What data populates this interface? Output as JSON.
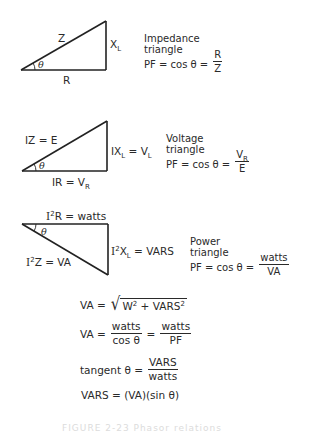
{
  "impedance": {
    "hyp_label": "Z",
    "vert_label_main": "X",
    "vert_label_sub": "L",
    "angle_label": "θ",
    "base_label": "R",
    "title_line1": "Impedance",
    "title_line2": "triangle",
    "pf_prefix": "PF = cos θ =",
    "pf_num": "R",
    "pf_den": "Z"
  },
  "voltage": {
    "hyp_label": "IZ = E",
    "vert_label_a": "IX",
    "vert_label_a_sub": "L",
    "vert_label_b": " = V",
    "vert_label_b_sub": "L",
    "angle_label": "θ",
    "base_label": "IR = V",
    "base_label_sub": "R",
    "title_line1": "Voltage",
    "title_line2": "triangle",
    "pf_prefix": "PF = cos θ =",
    "pf_num": "V",
    "pf_num_sub": "R",
    "pf_den": "E"
  },
  "power": {
    "top_label_a": "I",
    "top_label_sup": "2",
    "top_label_b": "R = watts",
    "hyp_label_a": "I",
    "hyp_label_sup": "2",
    "hyp_label_b": "Z = VA",
    "vert_label_a": "I",
    "vert_label_sup": "2",
    "vert_label_b": "X",
    "vert_label_sub": "L",
    "vert_label_c": " = VARS",
    "angle_label": "θ",
    "title_line1": "Power",
    "title_line2": "triangle",
    "pf_prefix": "PF = cos θ =",
    "pf_num": "watts",
    "pf_den": "VA"
  },
  "formulas": {
    "va_sqrt_prefix": "VA =",
    "va_sqrt_w": "W",
    "va_sqrt_sup1": "2",
    "va_sqrt_plus": " + VARS",
    "va_sqrt_sup2": "2",
    "va_frac_prefix": "VA =",
    "va_frac1_num": "watts",
    "va_frac1_den": "cos θ",
    "va_frac_eq": "=",
    "va_frac2_num": "watts",
    "va_frac2_den": "PF",
    "tan_prefix": "tangent θ =",
    "tan_num": "VARS",
    "tan_den": "watts",
    "vars_formula": "VARS = (VA)(sin θ)"
  },
  "caption": "FIGURE 2-23   Phasor relations"
}
